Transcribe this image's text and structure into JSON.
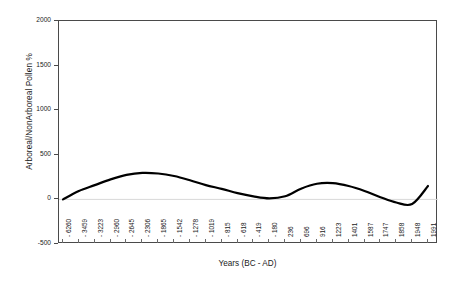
{
  "chart_data": {
    "type": "line",
    "title": "",
    "xlabel": "Years (BC - AD)",
    "ylabel": "Arboreal/NonArboreal Pollen %",
    "ylim": [
      -500,
      2000
    ],
    "y_ticks": [
      2000,
      1500,
      1000,
      500,
      0,
      -500
    ],
    "y_tick_labels": [
      "2000",
      "1500",
      "1000",
      "500",
      "0",
      "-500"
    ],
    "grid": false,
    "legend": "none",
    "line_color": "#000000",
    "line_width": 2.2,
    "categories": [
      "- 6260",
      "- 3459",
      "- 3223",
      "- 2960",
      "- 2645",
      "- 2306",
      "- 1865",
      "- 1542",
      "- 1278",
      "- 1019",
      "- 815",
      "- 618",
      "- 419",
      "- 180",
      "236",
      "696",
      "916",
      "1223",
      "1401",
      "1587",
      "1747",
      "1858",
      "1948",
      "1991"
    ],
    "values": [
      0,
      95,
      160,
      225,
      275,
      297,
      290,
      262,
      215,
      160,
      118,
      70,
      34,
      12,
      35,
      120,
      175,
      182,
      150,
      95,
      25,
      -35,
      -52,
      150
    ],
    "series": [
      {
        "name": "Arboreal/NonArboreal Pollen %",
        "values": [
          0,
          95,
          160,
          225,
          275,
          297,
          290,
          262,
          215,
          160,
          118,
          70,
          34,
          12,
          35,
          120,
          175,
          182,
          150,
          95,
          25,
          -35,
          -52,
          150
        ]
      }
    ]
  },
  "axes": {
    "frame_color": "#4a4a4a",
    "background": "#ffffff"
  }
}
